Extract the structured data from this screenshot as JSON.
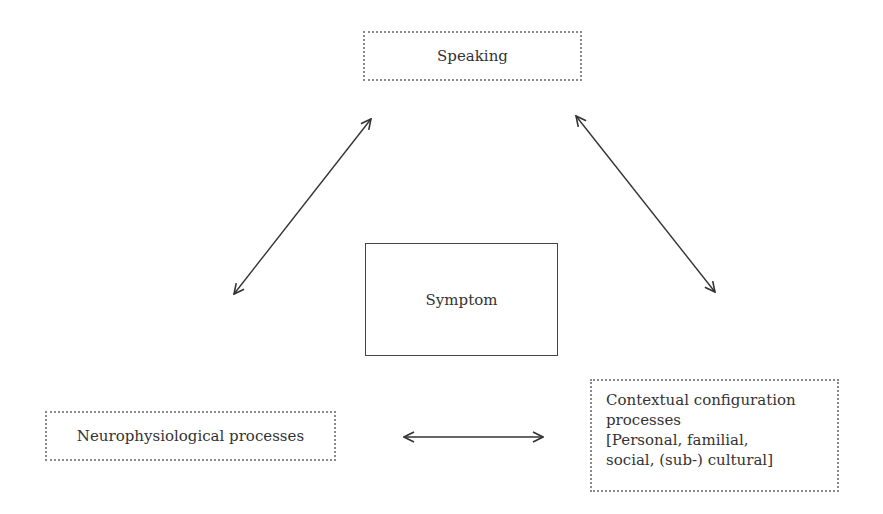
{
  "diagram": {
    "type": "relationship-triangle",
    "nodes": {
      "speaking": {
        "label": "Speaking",
        "border": "dotted"
      },
      "symptom": {
        "label": "Symptom",
        "border": "solid"
      },
      "neuro": {
        "label": "Neurophysiological processes",
        "border": "dotted"
      },
      "context": {
        "border": "dotted",
        "lines": [
          "Contextual configuration",
          "processes",
          "[Personal, familial,",
          "social, (sub-) cultural]"
        ]
      }
    },
    "edges": [
      {
        "from": "speaking",
        "to": "neuro",
        "style": "bidirectional-arrow"
      },
      {
        "from": "speaking",
        "to": "context",
        "style": "bidirectional-arrow"
      },
      {
        "from": "neuro",
        "to": "context",
        "style": "bidirectional-arrow"
      }
    ],
    "colors": {
      "text": "#333333",
      "arrow": "#333333",
      "dotted_border": "#8a8a8a",
      "solid_border": "#444444",
      "background": "#ffffff"
    }
  }
}
